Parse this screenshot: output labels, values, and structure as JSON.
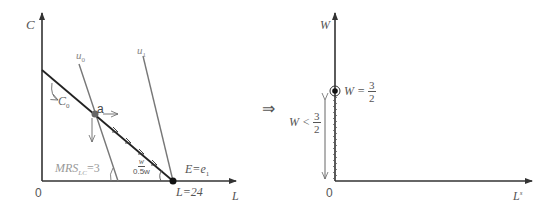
{
  "left_diagram": {
    "y_axis_label": "C",
    "x_axis_label": "L",
    "origin_label": "0",
    "curves": [
      {
        "name": "u0",
        "label": "u",
        "sub": "0"
      },
      {
        "name": "u1",
        "label": "u",
        "sub": "1"
      }
    ],
    "budget_label": {
      "main": "C",
      "sub": "0"
    },
    "point_a_label": "a",
    "mrs_label": {
      "main": "MRS",
      "sub": "LC",
      "value": "=3"
    },
    "slope_label": {
      "num": "w",
      "den": "0.5w"
    },
    "endowment_label": {
      "main": "E=e",
      "sub": "1"
    },
    "endowment_value": "L=24"
  },
  "implies_symbol": "⇒",
  "right_diagram": {
    "y_axis_label": "W",
    "x_axis_label": {
      "main": "L",
      "sup": "s"
    },
    "origin_label": "0",
    "point_label": {
      "left": "W =",
      "num": "3",
      "den": "2"
    },
    "range_label": {
      "left": "W <",
      "num": "3",
      "den": "2"
    }
  },
  "colors": {
    "axis": "#333333",
    "budget_line": "#222222",
    "indifference": "#777777",
    "label": "#555555",
    "point": "#111111"
  }
}
